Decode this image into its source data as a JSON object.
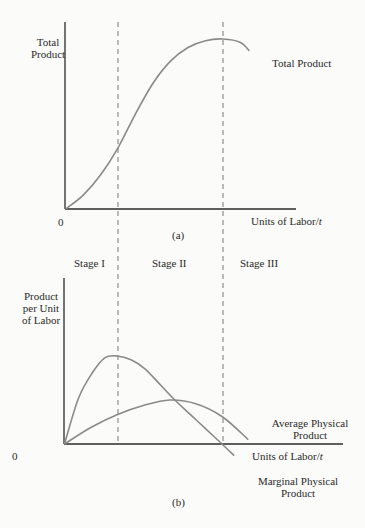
{
  "chart_data": [
    {
      "id": "a",
      "type": "line",
      "caption": "(a)",
      "title": "",
      "ylabel": "Total Product",
      "xlabel": "Units of Labor/t",
      "origin_label": "0",
      "grid": false,
      "stage_boundaries_labor": [
        3,
        9
      ],
      "series": [
        {
          "name": "Total Product",
          "label": "Total Product",
          "x": [
            0,
            1,
            2,
            3,
            4,
            5,
            6,
            7,
            8,
            9,
            10,
            10.5
          ],
          "y": [
            0,
            8,
            20,
            36,
            56,
            74,
            87,
            95,
            99,
            100,
            98,
            93
          ]
        }
      ],
      "annotations": [
        "inflection point at Stage I/II boundary",
        "maximum at Stage II/III boundary"
      ]
    },
    {
      "id": "b",
      "type": "line",
      "caption": "(b)",
      "title": "",
      "ylabel": "Product per Unit of Labor",
      "xlabel": "Units of Labor/t",
      "origin_label": "0",
      "grid": false,
      "stage_labels": [
        "Stage I",
        "Stage II",
        "Stage III"
      ],
      "stage_boundaries_labor": [
        3,
        9
      ],
      "series": [
        {
          "name": "Marginal Physical Product",
          "label": "Marginal Physical Product",
          "x": [
            0,
            0.8,
            1.6,
            2.3,
            3,
            3.8,
            4.6,
            5.5,
            6.3,
            7.2,
            8.1,
            9,
            9.7
          ],
          "y": [
            0,
            12.5,
            19.5,
            23.5,
            24,
            23,
            20.5,
            16,
            12,
            8,
            4,
            0,
            -3.2
          ]
        },
        {
          "name": "Average Physical Product",
          "label": "Average Physical Product",
          "x": [
            0,
            1.5,
            3,
            4.5,
            6,
            7.5,
            9,
            10.5
          ],
          "y": [
            0,
            4.5,
            8,
            10.5,
            12,
            11,
            7.5,
            1.2
          ]
        }
      ],
      "annotations": [
        "MPP peaks at Stage I/II boundary",
        "MPP intersects APP at APP maximum",
        "MPP reaches zero at Stage II/III boundary"
      ]
    }
  ],
  "labels": {
    "a_ylabel_1": "Total",
    "a_ylabel_2": "Product",
    "a_series": "Total Product",
    "a_origin": "0",
    "a_xlabel": "Units of Labor/",
    "a_xlabel_t": "t",
    "a_caption": "(a)",
    "stage_1": "Stage I",
    "stage_2": "Stage II",
    "stage_3": "Stage III",
    "b_ylabel_1": "Product",
    "b_ylabel_2": "per Unit",
    "b_ylabel_3": "of Labor",
    "b_origin": "0",
    "b_xlabel": "Units of Labor/",
    "b_xlabel_t": "t",
    "app_1": "Average Physical",
    "app_2": "Product",
    "mpp_1": "Marginal Physical",
    "mpp_2": "Product",
    "b_caption": "(b)"
  },
  "colors": {
    "axis": "#2b2b2b",
    "curve": "#8a8a8a",
    "dash": "#6a6a6a"
  }
}
